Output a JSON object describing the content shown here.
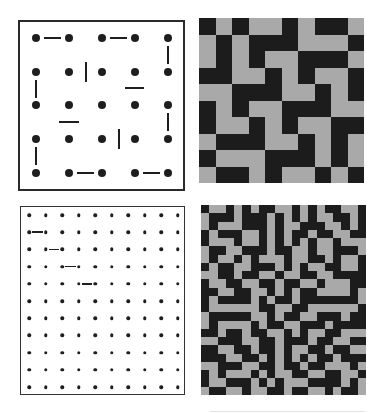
{
  "figure": {
    "panels": [
      {
        "id": "top-left",
        "type": "dot-domino-board",
        "box": {
          "x": 18,
          "y": 20,
          "w": 167,
          "h": 171
        },
        "dot_grid": {
          "cols": 5,
          "rows": 5,
          "x0": 36,
          "y0": 38,
          "dx": 33,
          "dy": 33.7,
          "dot_size": 8
        },
        "dominoes": [
          {
            "x1": 44,
            "y1": 38,
            "x2": 61,
            "y2": 38
          },
          {
            "x1": 110,
            "y1": 38,
            "x2": 127,
            "y2": 38
          },
          {
            "x1": 168,
            "y1": 46,
            "x2": 168,
            "y2": 64
          },
          {
            "x1": 86,
            "y1": 62,
            "x2": 86,
            "y2": 82
          },
          {
            "x1": 125,
            "y1": 88,
            "x2": 144,
            "y2": 88
          },
          {
            "x1": 36,
            "y1": 80,
            "x2": 36,
            "y2": 98
          },
          {
            "x1": 59,
            "y1": 122,
            "x2": 79,
            "y2": 122
          },
          {
            "x1": 119,
            "y1": 129,
            "x2": 119,
            "y2": 149
          },
          {
            "x1": 168,
            "y1": 113,
            "x2": 168,
            "y2": 131
          },
          {
            "x1": 36,
            "y1": 147,
            "x2": 36,
            "y2": 165
          },
          {
            "x1": 77,
            "y1": 173,
            "x2": 94,
            "y2": 173
          },
          {
            "x1": 143,
            "y1": 173,
            "x2": 160,
            "y2": 173
          }
        ]
      },
      {
        "id": "top-right",
        "type": "tile-grid",
        "origin": {
          "x": 199,
          "y": 18
        },
        "cell": 16.5,
        "cols": 10,
        "rows": 10,
        "colors": {
          "B": "#1c1c1c",
          "G": "#a9a9a9"
        },
        "cells": [
          "BGBGGBGBBG",
          "GBGBBBGGGB",
          "GBGBGGBBBG",
          "BBGGBGBGGB",
          "GGBBBGGBGB",
          "BGBGGBBBGG",
          "BGGBGBGGBB",
          "GBBBGGBGBG",
          "BGGGBBBGBG",
          "GBBGBGGBGB"
        ]
      },
      {
        "id": "bottom-left",
        "type": "dot-domino-board",
        "box": {
          "x": 20,
          "y": 206,
          "w": 165,
          "h": 189
        },
        "dot_grid": {
          "cols": 10,
          "rows": 11,
          "x0": 29,
          "y0": 215,
          "dx": 16.5,
          "dy": 17.2,
          "dot_size": 3.5
        },
        "dominoes": [
          {
            "x1": 32,
            "y1": 232.2,
            "x2": 42.5,
            "y2": 232.2
          },
          {
            "x1": 48.5,
            "y1": 249.4,
            "x2": 59,
            "y2": 249.4
          },
          {
            "x1": 65,
            "y1": 266.6,
            "x2": 75.5,
            "y2": 266.6
          },
          {
            "x1": 81.5,
            "y1": 283.8,
            "x2": 92,
            "y2": 283.8
          }
        ]
      },
      {
        "id": "bottom-right",
        "type": "tile-grid",
        "origin": {
          "x": 201,
          "y": 205
        },
        "cell": 8.25,
        "cols": 20,
        "rows": 23,
        "colors": {
          "B": "#1c1c1c",
          "G": "#a9a9a9"
        },
        "cells": [
          "BGGBGBGBBGGBGBGBBGGB",
          "GBBBGBBBGBGBGBGGBBGB",
          "GBGGGBBBGBGGBBBGGBGB",
          "BGBBBGGBGBGBBGBBGGBB",
          "BGGGBGGBGBGBGBGGBGGG",
          "GBBGGBBBGBBGGBGGBBBG",
          "GBGGBGBGGGBGGBBGBGGB",
          "BGBBGGBBBGBGBGGBBGGB",
          "GGBBGBBGGBGGBBGGBBBB",
          "BGGBBGGBBGBBGGBGGGBB",
          "BBGGBBGGBGBGBBGGGGBG",
          "BGBBBBGBGBBGBBBBBBBG",
          "BGGGGGGBBGGBBGGGGGGB",
          "GBBBBBGGBGBBGGBBBGBB",
          "GBGGGGBGBBGGBBBGBBBB",
          "BBGBBGBBGGBGBGGBBGGG",
          "GGBBBGGBBGBBBGBBGGBB",
          "BBGGBBGBBGBGGBBGBBGG",
          "BBBGGBBGBGBGBGBBGBBB",
          "GGBBBGGBBGBBGBBGGGBG",
          "BGBGGGBGBGGBBGGBBGGB",
          "BGGBBBGBGBGGGBBBBGBG",
          "GBBGGBGGBBGBBGGBGBBG"
        ]
      }
    ],
    "footer_rule": {
      "x": 210,
      "y": 411,
      "w": 155
    }
  }
}
